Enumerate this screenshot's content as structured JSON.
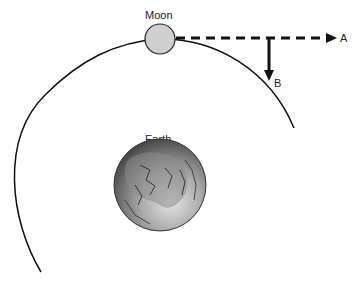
{
  "labels": {
    "moon": "Moon",
    "earth": "Earth",
    "arrow_a": "A",
    "arrow_b": "B"
  },
  "colors": {
    "moon_fill": "#cfcfcf",
    "orbit_stroke": "#111111",
    "earth_dark": "#3a3a3a",
    "earth_light": "#d8d8d8"
  }
}
